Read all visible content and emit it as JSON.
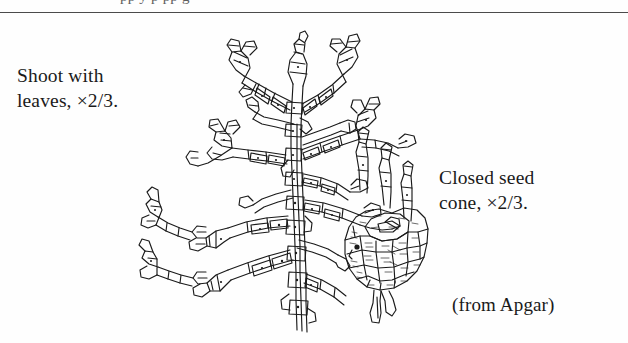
{
  "figure": {
    "type": "botanical-line-drawing",
    "background_color": "#fefefe",
    "ink_color": "#1a1a1a",
    "rule_color": "#4b4b4b",
    "partial_text_above_rule": "pp y p pp g",
    "captions": {
      "shoot": "Shoot with\nleaves, ×2/3.",
      "cone": "Closed seed\ncone, ×2/3.",
      "attribution": "(from Apgar)"
    }
  }
}
